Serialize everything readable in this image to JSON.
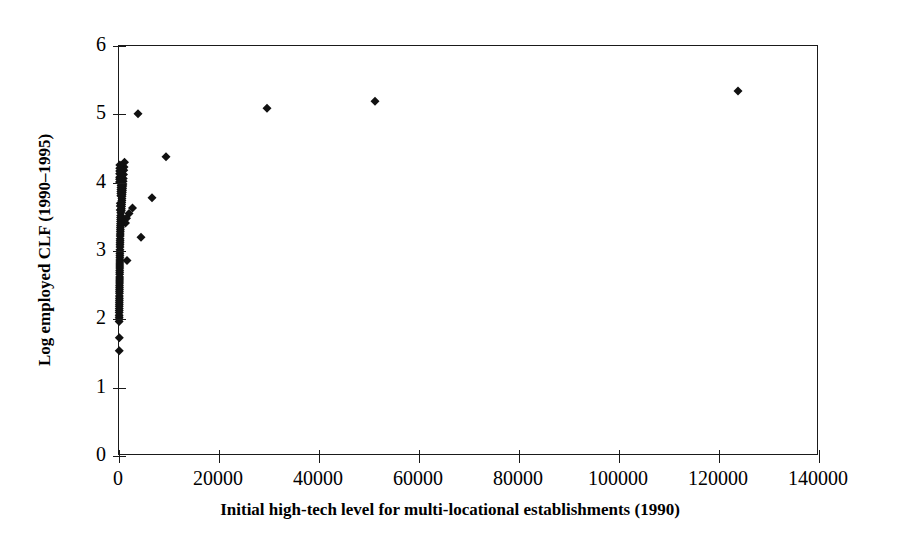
{
  "chart_data": {
    "type": "scatter",
    "title": "",
    "xlabel": "Initial high-tech level for multi-locational establishments (1990)",
    "ylabel": "Log employed CLF (1990–1995)",
    "xlim": [
      0,
      140000
    ],
    "ylim": [
      0,
      6
    ],
    "xticks": [
      0,
      20000,
      40000,
      60000,
      80000,
      100000,
      120000,
      140000
    ],
    "xtick_labels": [
      "0",
      "20000",
      "40000",
      "60000",
      "80000",
      "100000",
      "120000",
      "140000"
    ],
    "yticks": [
      0,
      1,
      2,
      3,
      4,
      5,
      6
    ],
    "ytick_labels": [
      "0",
      "1",
      "2",
      "3",
      "4",
      "5",
      "6"
    ],
    "grid": false,
    "legend": null,
    "marker": {
      "shape": "diamond",
      "color": "#111111",
      "size_px": 9
    },
    "series": [
      {
        "name": "Metropolitan areas",
        "points": [
          [
            3800,
            5.01
          ],
          [
            29600,
            5.09
          ],
          [
            51200,
            5.19
          ],
          [
            123800,
            5.34
          ],
          [
            9400,
            4.38
          ],
          [
            6600,
            3.78
          ],
          [
            4400,
            3.2
          ],
          [
            2700,
            3.63
          ],
          [
            2000,
            3.55
          ],
          [
            1500,
            3.48
          ],
          [
            1300,
            3.41
          ],
          [
            1100,
            4.3
          ],
          [
            1000,
            4.23
          ],
          [
            950,
            4.18
          ],
          [
            900,
            4.12
          ],
          [
            850,
            4.06
          ],
          [
            820,
            4.02
          ],
          [
            790,
            3.98
          ],
          [
            760,
            3.95
          ],
          [
            730,
            3.92
          ],
          [
            700,
            3.89
          ],
          [
            670,
            3.86
          ],
          [
            640,
            3.83
          ],
          [
            610,
            3.8
          ],
          [
            590,
            3.77
          ],
          [
            570,
            3.74
          ],
          [
            550,
            3.71
          ],
          [
            530,
            3.68
          ],
          [
            510,
            3.65
          ],
          [
            490,
            3.62
          ],
          [
            470,
            3.59
          ],
          [
            450,
            4.15
          ],
          [
            440,
            4.09
          ],
          [
            430,
            4.04
          ],
          [
            420,
            4.0
          ],
          [
            410,
            3.96
          ],
          [
            400,
            3.93
          ],
          [
            390,
            3.9
          ],
          [
            380,
            3.87
          ],
          [
            370,
            3.84
          ],
          [
            360,
            3.81
          ],
          [
            350,
            3.56
          ],
          [
            340,
            3.52
          ],
          [
            330,
            3.49
          ],
          [
            320,
            3.46
          ],
          [
            310,
            3.43
          ],
          [
            300,
            3.4
          ],
          [
            290,
            3.37
          ],
          [
            280,
            3.34
          ],
          [
            270,
            3.31
          ],
          [
            260,
            3.28
          ],
          [
            250,
            3.25
          ],
          [
            240,
            3.22
          ],
          [
            230,
            3.18
          ],
          [
            220,
            3.15
          ],
          [
            210,
            3.12
          ],
          [
            200,
            3.09
          ],
          [
            195,
            3.06
          ],
          [
            190,
            3.02
          ],
          [
            185,
            2.99
          ],
          [
            180,
            2.96
          ],
          [
            175,
            2.93
          ],
          [
            1600,
            2.86
          ],
          [
            170,
            2.9
          ],
          [
            165,
            2.87
          ],
          [
            160,
            2.84
          ],
          [
            155,
            2.81
          ],
          [
            150,
            2.78
          ],
          [
            145,
            2.75
          ],
          [
            140,
            2.72
          ],
          [
            135,
            2.69
          ],
          [
            130,
            2.66
          ],
          [
            125,
            2.62
          ],
          [
            120,
            2.59
          ],
          [
            115,
            2.56
          ],
          [
            110,
            2.53
          ],
          [
            105,
            2.5
          ],
          [
            100,
            2.47
          ],
          [
            95,
            2.44
          ],
          [
            90,
            2.41
          ],
          [
            85,
            2.38
          ],
          [
            80,
            2.34
          ],
          [
            75,
            2.31
          ],
          [
            70,
            2.28
          ],
          [
            65,
            2.25
          ],
          [
            60,
            2.22
          ],
          [
            55,
            2.19
          ],
          [
            50,
            2.16
          ],
          [
            45,
            2.13
          ],
          [
            42,
            2.1
          ],
          [
            39,
            2.06
          ],
          [
            36,
            2.03
          ],
          [
            33,
            2.0
          ],
          [
            30,
            1.97
          ],
          [
            160,
            4.26
          ],
          [
            150,
            4.21
          ],
          [
            140,
            4.17
          ],
          [
            130,
            4.13
          ],
          [
            120,
            4.08
          ],
          [
            110,
            4.05
          ],
          [
            100,
            4.01
          ],
          [
            260,
            3.7
          ],
          [
            250,
            3.66
          ],
          [
            240,
            3.6
          ],
          [
            60,
            1.73
          ],
          [
            55,
            1.54
          ]
        ]
      }
    ]
  },
  "axes": {
    "ylabel": "Log employed CLF (1990–1995)",
    "xlabel": "Initial high-tech level for multi-locational establishments (1990)"
  }
}
